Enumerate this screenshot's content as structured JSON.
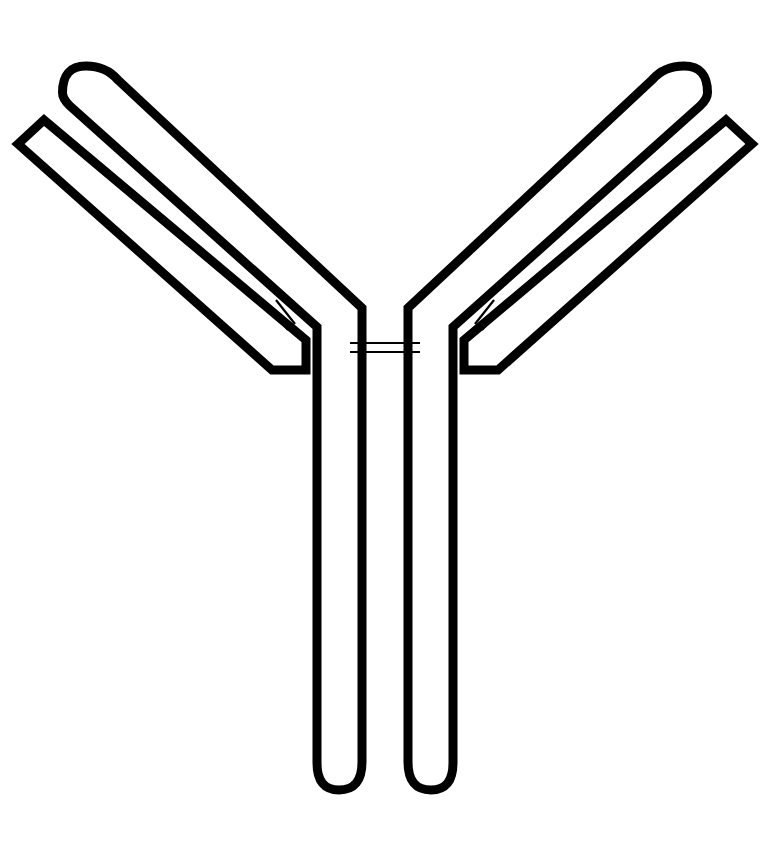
{
  "figure": {
    "background_color": "#ffffff",
    "stroke_color": "#000000",
    "canvas": {
      "width": 770,
      "height": 865
    }
  },
  "style": {
    "chain_stroke_width": 9,
    "disulfide_stroke_width": 2.2
  },
  "parts": {
    "heavy_chain_left": {
      "label": "heavy-chain-left",
      "tip_shape": "rounded",
      "path": "M 78 78 L 345 328 L 345 778"
    },
    "heavy_chain_right": {
      "label": "heavy-chain-right",
      "tip_shape": "rounded",
      "path": "M 692 78 L 425 328 L 425 778"
    },
    "light_chain_left": {
      "label": "light-chain-left",
      "tip_shape": "mitered",
      "path": "M 27 142 L 293 363"
    },
    "light_chain_right": {
      "label": "light-chain-right",
      "tip_shape": "mitered",
      "path": "M 743 142 L 477 363"
    },
    "disulfide_hinge": {
      "label": "disulfide-bond-hinge",
      "count": 2,
      "orientation": "horizontal"
    },
    "disulfide_left_arm": {
      "label": "disulfide-bond-left-arm",
      "count": 2,
      "orientation": "diagonal"
    },
    "disulfide_right_arm": {
      "label": "disulfide-bond-right-arm",
      "count": 2,
      "orientation": "diagonal"
    }
  },
  "geometry": {
    "heavy_left_outer": "M 62.5 92.5 Q 62.5 66 86 66 Q 106 66 118 80 L 362 308 L 362 762 Q 362 790 339 790 Q 317 790 317 763 L 317 327 L 70 106 Q 62.5 99 62.5 92.5 Z",
    "heavy_right_outer": "M 707.5 92.5 Q 707.5 66 684 66 Q 664 66 652 80 L 408 308 L 408 762 Q 408 790 431 790 Q 453 790 453 763 L 453 327 L 700 106 Q 707.5 99 707.5 92.5 Z",
    "light_left_outer": "M 18 144 L 44 120 L 306 340 L 306 370 L 272 370 Z",
    "light_right_outer": "M 752 144 L 726 120 L 464 340 L 464 370 L 498 370 Z",
    "hinge_bond_1": "M 350 343 L 420 343",
    "hinge_bond_2": "M 350 352 L 420 352",
    "left_arm_bond_1": "M 276 300 L 295 324",
    "left_arm_bond_2": "M 269 306 L 288 330",
    "right_arm_bond_1": "M 494 300 L 475 324",
    "right_arm_bond_2": "M 501 306 L 482 330"
  }
}
